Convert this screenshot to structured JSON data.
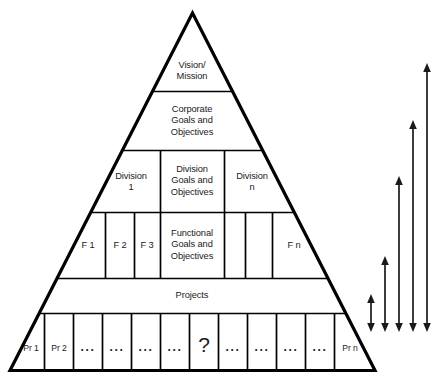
{
  "diagram": {
    "type": "pyramid-hierarchy",
    "stroke_color": "#000000",
    "text_color": "#1a1a1a",
    "background_color": "#ffffff",
    "levels": [
      {
        "id": "vision",
        "label": "Vision/\nMission",
        "cells": [
          "Vision/\nMission"
        ]
      },
      {
        "id": "corporate",
        "label": "Corporate\nGoals and\nObjectives",
        "cells": [
          "Corporate\nGoals and\nObjectives"
        ]
      },
      {
        "id": "division",
        "label": "Division Goals and Objectives",
        "cells": [
          "Division\n1",
          "Division\nGoals and\nObjectives",
          "Division\nn"
        ]
      },
      {
        "id": "functional",
        "label": "Functional Goals and Objectives",
        "cells": [
          "F 1",
          "F 2",
          "F 3",
          "Functional\nGoals and\nObjectives",
          "",
          "",
          "F n"
        ]
      },
      {
        "id": "projects",
        "label": "Projects",
        "cells": [
          "Projects"
        ]
      },
      {
        "id": "project-items",
        "label": "Project items",
        "cells": [
          "Pr 1",
          "Pr 2",
          "...",
          "...",
          "...",
          "...",
          "?",
          "...",
          "...",
          "...",
          "...",
          "Pr n"
        ]
      }
    ],
    "cell_labels": {
      "vision_mission": "Vision/\nMission",
      "corporate_goals": "Corporate\nGoals and\nObjectives",
      "division_1": "Division\n1",
      "division_goals": "Division\nGoals and\nObjectives",
      "division_n": "Division\nn",
      "f1": "F 1",
      "f2": "F 2",
      "f3": "F 3",
      "functional_goals": "Functional\nGoals and\nObjectives",
      "fn": "F n",
      "projects": "Projects",
      "pr1": "Pr 1",
      "pr2": "Pr 2",
      "ellipsis": "...",
      "question": "?",
      "prn": "Pr n"
    },
    "scope_arrows": {
      "count": 5,
      "description": "Five double-headed vertical span arrows at right, increasing in length",
      "items": [
        {
          "id": "arrow-1",
          "span": "projects-to-project-items"
        },
        {
          "id": "arrow-2",
          "span": "functional-to-project-items"
        },
        {
          "id": "arrow-3",
          "span": "division-to-project-items"
        },
        {
          "id": "arrow-4",
          "span": "corporate-to-project-items"
        },
        {
          "id": "arrow-5",
          "span": "vision-to-project-items"
        }
      ]
    }
  }
}
